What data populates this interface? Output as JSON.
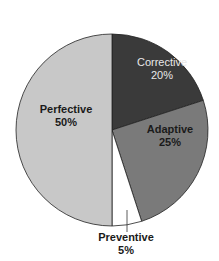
{
  "chart_data": {
    "type": "pie",
    "title": "",
    "categories": [
      "Corrective",
      "Adaptive",
      "Preventive",
      "Perfective"
    ],
    "values": [
      20,
      25,
      5,
      50
    ],
    "unit": "%",
    "colors": [
      "#3a3a3a",
      "#7a7a7a",
      "#ffffff",
      "#c8c8c8"
    ],
    "start_angle": "12 o'clock",
    "direction": "clockwise",
    "labels": [
      {
        "name": "Corrective",
        "value": "20%"
      },
      {
        "name": "Adaptive",
        "value": "25%"
      },
      {
        "name": "Preventive",
        "value": "5%"
      },
      {
        "name": "Perfective",
        "value": "50%"
      }
    ]
  }
}
